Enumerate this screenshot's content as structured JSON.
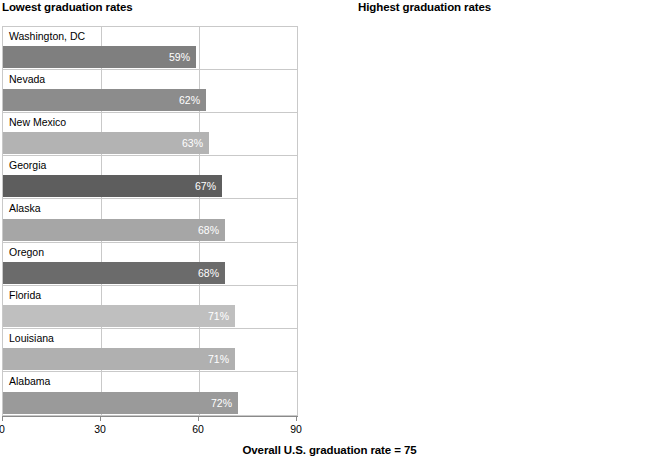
{
  "footer": {
    "note": "Overall U.S. graduation rate = 75"
  },
  "panels": {
    "lowest": {
      "title": "Lowest graduation rates"
    },
    "highest": {
      "title": "Highest graduation rates"
    }
  },
  "axis": {
    "ticks": [
      "0",
      "30",
      "60",
      "90"
    ],
    "tick_values": [
      0,
      30,
      60,
      90
    ],
    "min": 0,
    "max": 90
  },
  "chart_data": [
    {
      "type": "bar",
      "orientation": "horizontal",
      "title": "Lowest graduation rates",
      "xlabel": "",
      "ylabel": "",
      "xlim": [
        0,
        90
      ],
      "grid": true,
      "legend": false,
      "value_suffix": "%",
      "categories": [
        "Washington, DC",
        "Nevada",
        "New Mexico",
        "Georgia",
        "Alaska",
        "Oregon",
        "Florida",
        "Louisiana",
        "Alabama"
      ],
      "values": [
        59,
        62,
        63,
        67,
        68,
        68,
        71,
        71,
        72
      ],
      "value_labels": [
        "59%",
        "62%",
        "63%",
        "67%",
        "68%",
        "68%",
        "71%",
        "71%",
        "72%"
      ],
      "bar_colors": [
        "#7f7f7f",
        "#8c8c8c",
        "#b3b3b3",
        "#5e5e5e",
        "#a6a6a6",
        "#6b6b6b",
        "#bfbfbf",
        "#b0b0b0",
        "#9a9a9a"
      ]
    },
    {
      "type": "bar",
      "orientation": "horizontal",
      "title": "Highest graduation rates",
      "xlabel": "",
      "ylabel": "",
      "xlim": [
        0,
        90
      ],
      "grid": true,
      "legend": false,
      "value_suffix": "%",
      "categories": [
        "Iowa",
        "Wisconsin",
        "Vermont",
        "Texas",
        "Tennessee",
        "North Dakota",
        "New Hampshire",
        "Nebraska",
        "Indiana"
      ],
      "values": [
        88,
        87,
        87,
        86,
        86,
        86,
        86,
        86,
        86
      ],
      "value_labels": [
        "88%",
        "87%",
        "87%",
        "86%",
        "86%",
        "86%",
        "86%",
        "86%",
        "86%"
      ],
      "bar_colors": [
        "#8a8a8a",
        "#b2b2b2",
        "#c0c0c0",
        "#6e6e6e",
        "#a8a8a8",
        "#585858",
        "#bdbdbd",
        "#797979",
        "#757575"
      ]
    }
  ],
  "annotation": {
    "overall_rate": 75
  }
}
